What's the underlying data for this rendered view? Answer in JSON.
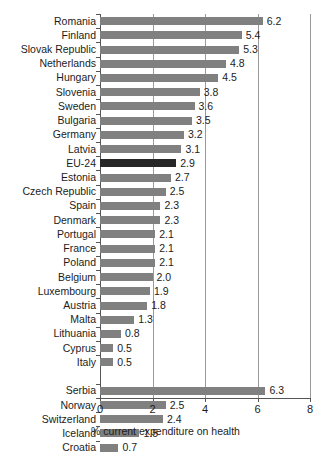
{
  "chart_data": {
    "type": "bar",
    "orientation": "horizontal",
    "title": "",
    "xlabel": "% current expenditure on health",
    "ylabel": "",
    "xlim": [
      0,
      8
    ],
    "xticks": [
      0,
      2,
      4,
      6,
      8
    ],
    "xtick_labels": [
      "0",
      "2",
      "4",
      "6",
      "8"
    ],
    "gridlines": [
      2,
      4,
      6
    ],
    "grid": true,
    "legend": null,
    "value_label_format": "one decimal",
    "colors": {
      "bar": "#808080",
      "highlight_bar": "#262626",
      "axis": "#555555",
      "gridline": "#9a9a9a",
      "text": "#1c1c1c",
      "background": "#ffffff"
    },
    "highlight_category": "EU-24",
    "groups": [
      {
        "name": "eu",
        "categories": [
          "Romania",
          "Finland",
          "Slovak Republic",
          "Netherlands",
          "Hungary",
          "Slovenia",
          "Sweden",
          "Bulgaria",
          "Germany",
          "Latvia",
          "EU-24",
          "Estonia",
          "Czech Republic",
          "Spain",
          "Denmark",
          "Portugal",
          "France",
          "Poland",
          "Belgium",
          "Luxembourg",
          "Austria",
          "Malta",
          "Lithuania",
          "Cyprus",
          "Italy"
        ],
        "values": [
          6.2,
          5.4,
          5.3,
          4.8,
          4.5,
          3.8,
          3.6,
          3.5,
          3.2,
          3.1,
          2.9,
          2.7,
          2.5,
          2.3,
          2.3,
          2.1,
          2.1,
          2.1,
          2.0,
          1.9,
          1.8,
          1.3,
          0.8,
          0.5,
          0.5
        ],
        "labels": [
          "6.2",
          "5.4",
          "5.3",
          "4.8",
          "4.5",
          "3.8",
          "3.6",
          "3.5",
          "3.2",
          "3.1",
          "2.9",
          "2.7",
          "2.5",
          "2.3",
          "2.3",
          "2.1",
          "2.1",
          "2.1",
          "2.0",
          "1.9",
          "1.8",
          "1.3",
          "0.8",
          "0.5",
          "0.5"
        ]
      },
      {
        "name": "non_eu",
        "categories": [
          "Serbia",
          "Norway",
          "Switzerland",
          "Iceland",
          "Croatia"
        ],
        "values": [
          6.3,
          2.5,
          2.4,
          1.5,
          0.7
        ],
        "labels": [
          "6.3",
          "2.5",
          "2.4",
          "1.5",
          "0.7"
        ]
      }
    ]
  }
}
